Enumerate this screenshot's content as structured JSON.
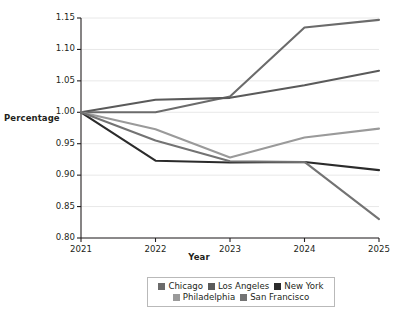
{
  "chart_data": {
    "type": "line",
    "title": "",
    "xlabel": "Year",
    "ylabel": "Percentage",
    "x": [
      2021,
      2022,
      2023,
      2024,
      2025
    ],
    "xticklabels": [
      "2021",
      "2022",
      "2023",
      "2024",
      "2025"
    ],
    "yticklabels": [
      "0.80",
      "0.85",
      "0.90",
      "0.95",
      "1.00",
      "1.05",
      "1.10",
      "1.15"
    ],
    "yticks": [
      0.8,
      0.85,
      0.9,
      0.95,
      1.0,
      1.05,
      1.1,
      1.15
    ],
    "ylim": [
      0.8,
      1.15
    ],
    "xlim": [
      2021,
      2025
    ],
    "grid": true,
    "legend_position": "below-center",
    "series": [
      {
        "name": "Chicago",
        "color": "#6b6b6b",
        "values": [
          1.0,
          1.0,
          1.025,
          1.135,
          1.147
        ]
      },
      {
        "name": "Los Angeles",
        "color": "#5a5a5a",
        "values": [
          1.0,
          1.02,
          1.023,
          1.043,
          1.066
        ]
      },
      {
        "name": "New York",
        "color": "#2b2b2b",
        "values": [
          1.0,
          0.923,
          0.92,
          0.921,
          0.908
        ]
      },
      {
        "name": "Philadelphia",
        "color": "#9a9a9a",
        "values": [
          1.0,
          0.973,
          0.928,
          0.96,
          0.974
        ]
      },
      {
        "name": "San Francisco",
        "color": "#737373",
        "values": [
          1.0,
          0.955,
          0.922,
          0.921,
          0.83
        ]
      }
    ]
  },
  "legend": {
    "rows": [
      [
        "Chicago",
        "Los Angeles",
        "New York"
      ],
      [
        "Philadelphia",
        "San Francisco"
      ]
    ]
  },
  "colors": {
    "axis": "#231f20",
    "grid": "#e8e8e8",
    "legend_border": "#b9b9b9",
    "background": "#ffffff"
  }
}
